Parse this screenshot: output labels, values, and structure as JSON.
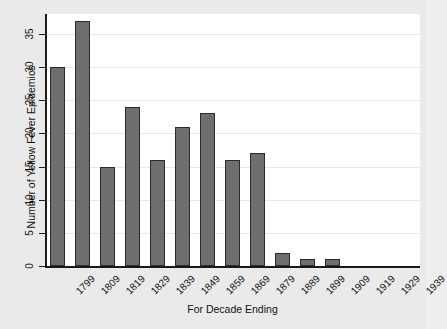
{
  "chart_data": {
    "type": "bar",
    "title": "",
    "xlabel": "For Decade Ending",
    "ylabel": "Number of Yellow Fever Epidemics",
    "categories": [
      "1799",
      "1809",
      "1819",
      "1829",
      "1839",
      "1849",
      "1859",
      "1869",
      "1879",
      "1889",
      "1899",
      "1909",
      "1919",
      "1929",
      "1939"
    ],
    "values": [
      30,
      37,
      15,
      24,
      16,
      21,
      23,
      16,
      17,
      2,
      1,
      1,
      0,
      0,
      0
    ],
    "ylim": [
      0,
      38
    ],
    "yticks": [
      0,
      5,
      10,
      15,
      20,
      25,
      30,
      35
    ],
    "ytick_labels": [
      "0",
      "5",
      "10",
      "15",
      "20",
      "25",
      "30",
      "35"
    ],
    "grid": true,
    "grid_axis": "y",
    "legend": false,
    "bar_color": "#6e6e6e",
    "bar_edge_color": "#2b2b2b",
    "plot_background": "#ffffff",
    "figure_background": "#eaeaea",
    "axis_color": "#1a1a1a",
    "gridline_color": "#e8e8e8"
  }
}
